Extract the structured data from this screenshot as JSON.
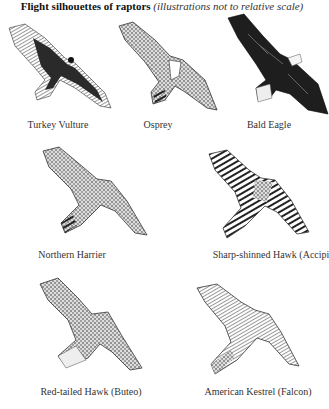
{
  "title": {
    "main": "Flight silhouettes of raptors",
    "subtitle": "(illustrations not to relative scale)"
  },
  "birds": [
    {
      "name": "Turkey Vulture",
      "icon": "turkey-vulture-illustration",
      "tone": "#2a2a2a"
    },
    {
      "name": "Osprey",
      "icon": "osprey-illustration",
      "tone": "#555555"
    },
    {
      "name": "Bald Eagle",
      "icon": "bald-eagle-illustration",
      "tone": "#1e1e1e"
    },
    {
      "name": "Northern Harrier",
      "icon": "northern-harrier-illustration",
      "tone": "#555555"
    },
    {
      "name": "Sharp-shinned Hawk (Accipi",
      "icon": "sharp-shinned-hawk-illustration",
      "tone": "#444444"
    },
    {
      "name": "Red-tailed Hawk (Buteo)",
      "icon": "red-tailed-hawk-illustration",
      "tone": "#4a4a4a"
    },
    {
      "name": "American Kestrel (Falcon)",
      "icon": "american-kestrel-illustration",
      "tone": "#555555"
    }
  ]
}
